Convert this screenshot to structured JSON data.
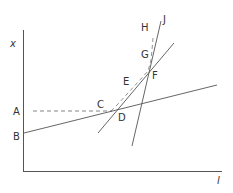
{
  "axes": {
    "y_label": "x",
    "x_label": "l"
  },
  "points": {
    "A": "A",
    "B": "B",
    "C": "C",
    "D": "D",
    "E": "E",
    "F": "F",
    "G": "G",
    "H": "H",
    "J": "J"
  },
  "colors": {
    "line": "#555555",
    "text": "#333333",
    "background": "#ffffff"
  }
}
